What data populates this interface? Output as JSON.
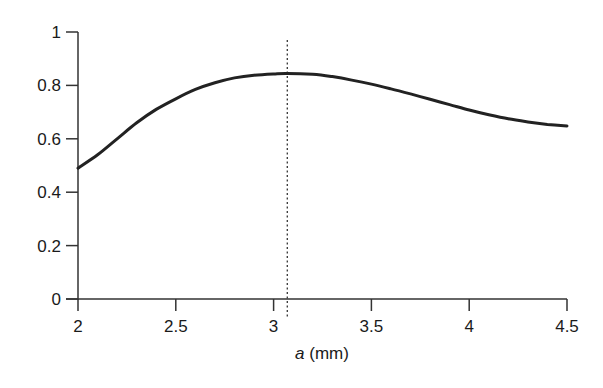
{
  "chart_data": {
    "type": "line",
    "title": "",
    "xlabel_italic": "a",
    "xlabel_rest": " (mm)",
    "xlabel": "a (mm)",
    "ylabel": "",
    "xlim": [
      2,
      4.5
    ],
    "ylim": [
      0,
      1
    ],
    "xticks": [
      2,
      2.5,
      3,
      3.5,
      4,
      4.5
    ],
    "xtick_labels": [
      "2",
      "2.5",
      "3",
      "3.5",
      "4",
      "4.5"
    ],
    "yticks": [
      0,
      0.2,
      0.4,
      0.6,
      0.8,
      1
    ],
    "ytick_labels": [
      "0",
      "0.2",
      "0.4",
      "0.6",
      "0.8",
      "1"
    ],
    "grid": false,
    "legend": null,
    "series": [
      {
        "name": "curve",
        "color": "#222222",
        "x": [
          2.0,
          2.1,
          2.2,
          2.3,
          2.4,
          2.5,
          2.6,
          2.7,
          2.8,
          2.9,
          3.0,
          3.07,
          3.2,
          3.3,
          3.4,
          3.5,
          3.6,
          3.7,
          3.8,
          3.9,
          4.0,
          4.1,
          4.2,
          4.3,
          4.4,
          4.5
        ],
        "y": [
          0.49,
          0.54,
          0.6,
          0.66,
          0.71,
          0.75,
          0.785,
          0.81,
          0.828,
          0.838,
          0.843,
          0.845,
          0.842,
          0.833,
          0.82,
          0.805,
          0.787,
          0.768,
          0.748,
          0.728,
          0.708,
          0.69,
          0.675,
          0.663,
          0.654,
          0.648
        ]
      }
    ],
    "annotations": [
      {
        "type": "vertical_dotted_line",
        "x": 3.07,
        "label": ""
      }
    ]
  }
}
